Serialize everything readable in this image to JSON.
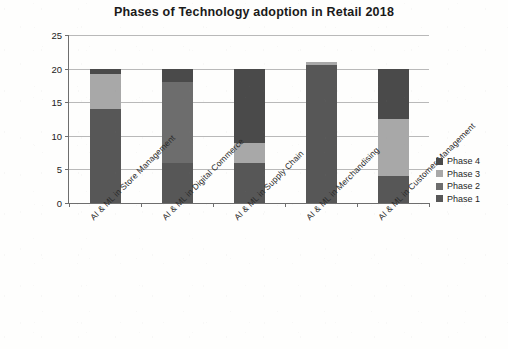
{
  "chart_data": {
    "type": "bar",
    "stacked": true,
    "title": "Phases of Technology adoption in Retail 2018",
    "xlabel": "",
    "ylabel": "",
    "ylim": [
      0,
      25
    ],
    "yticks": [
      0,
      5,
      10,
      15,
      20,
      25
    ],
    "grid": true,
    "legend_position": "right",
    "categories": [
      "AI & ML in Store Management",
      "AI & ML in Digital Commerce",
      "AI & ML in Supply Chain",
      "AI & ML in Merchandising",
      "AI & ML in Customer Management"
    ],
    "series": [
      {
        "name": "Phase 1",
        "color": "#575757",
        "values": [
          14,
          6,
          6,
          20.5,
          4
        ]
      },
      {
        "name": "Phase 2",
        "color": "#6d6d6d",
        "values": [
          0,
          12,
          0,
          0,
          0
        ]
      },
      {
        "name": "Phase 3",
        "color": "#a8a8a8",
        "values": [
          5.2,
          0,
          3,
          0.5,
          8.5
        ]
      },
      {
        "name": "Phase 4",
        "color": "#4a4a4a",
        "values": [
          0.8,
          2,
          11,
          0,
          7.5
        ]
      }
    ],
    "totals": [
      20,
      20,
      20,
      21,
      20
    ]
  },
  "legend": {
    "items": [
      {
        "label": "Phase 4",
        "color": "#4a4a4a"
      },
      {
        "label": "Phase 3",
        "color": "#a8a8a8"
      },
      {
        "label": "Phase 2",
        "color": "#6d6d6d"
      },
      {
        "label": "Phase 1",
        "color": "#575757"
      }
    ]
  },
  "axis": {
    "y_tick_labels": [
      "0",
      "5",
      "10",
      "15",
      "20",
      "25"
    ]
  }
}
